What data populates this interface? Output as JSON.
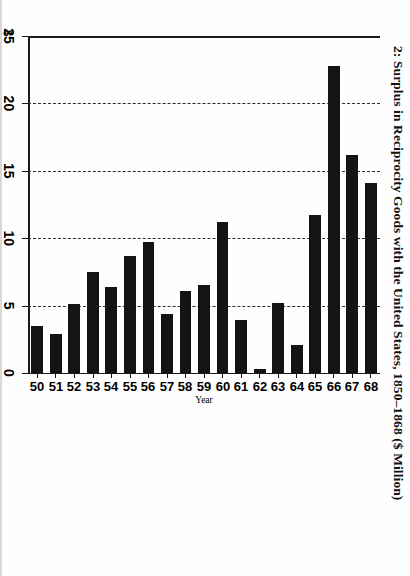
{
  "figure": {
    "title": "2: Surplus in Reciprocity Goods with the United States, 1850–1868 ($ Million)",
    "currency_symbol": "$"
  },
  "chart_data": {
    "type": "bar",
    "orientation": "horizontal-rotated",
    "title": "2: Surplus in Reciprocity Goods with the United States, 1850–1868 ($ Million)",
    "xlabel": "Year",
    "ylabel": "$",
    "ylim": [
      0,
      25
    ],
    "yticks": [
      0,
      5,
      10,
      15,
      20,
      25
    ],
    "ytick_labels": [
      "0",
      "5",
      "10",
      "15",
      "20",
      "25"
    ],
    "grid": true,
    "grid_style": "dashed",
    "legend": "none",
    "bar_color": "#141414",
    "categories": [
      "50",
      "51",
      "52",
      "53",
      "54",
      "55",
      "56",
      "57",
      "58",
      "59",
      "60",
      "61",
      "62",
      "63",
      "64",
      "65",
      "66",
      "67",
      "68"
    ],
    "category_full_years": [
      1850,
      1851,
      1852,
      1853,
      1854,
      1855,
      1856,
      1857,
      1858,
      1859,
      1860,
      1861,
      1862,
      1863,
      1864,
      1865,
      1866,
      1867,
      1868
    ],
    "values": [
      3.5,
      2.9,
      5.1,
      7.5,
      6.4,
      8.7,
      9.7,
      4.4,
      6.1,
      6.5,
      11.2,
      3.9,
      0.3,
      5.2,
      2.1,
      11.7,
      22.8,
      16.2,
      14.1
    ],
    "units": "$ Million"
  }
}
